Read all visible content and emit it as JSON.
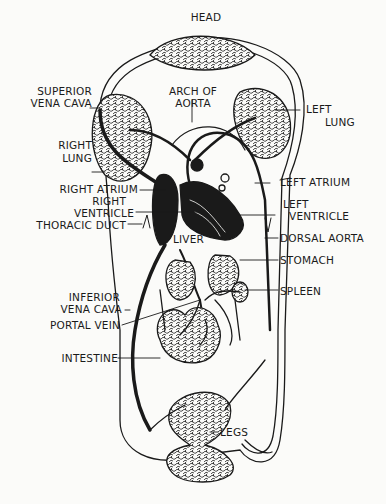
{
  "diagram": {
    "colors": {
      "ink": "#1a1a1a",
      "paper": "#fbfbf9"
    },
    "labels": {
      "head": "HEAD",
      "superior_vena_cava_1": "SUPERIOR",
      "superior_vena_cava_2": "VENA CAVA",
      "arch_of_aorta_1": "ARCH OF",
      "arch_of_aorta_2": "AORTA",
      "left_lung_1": "LEFT",
      "left_lung_2": "LUNG",
      "right_lung_1": "RIGHT",
      "right_lung_2": "LUNG",
      "right_atrium": "RIGHT ATRIUM",
      "right_ventricle_1": "RIGHT",
      "right_ventricle_2": "VENTRICLE",
      "thoracic_duct": "THORACIC DUCT",
      "left_atrium": "LEFT ATRIUM",
      "left_ventricle_1": "LEFT",
      "left_ventricle_2": "VENTRICLE",
      "liver": "LIVER",
      "dorsal_aorta": "DORSAL AORTA",
      "stomach": "STOMACH",
      "spleen": "SPLEEN",
      "inferior_vena_cava_1": "INFERIOR",
      "inferior_vena_cava_2": "VENA CAVA",
      "portal_vein": "PORTAL VEIN",
      "intestine": "INTESTINE",
      "legs": "LEGS"
    }
  }
}
